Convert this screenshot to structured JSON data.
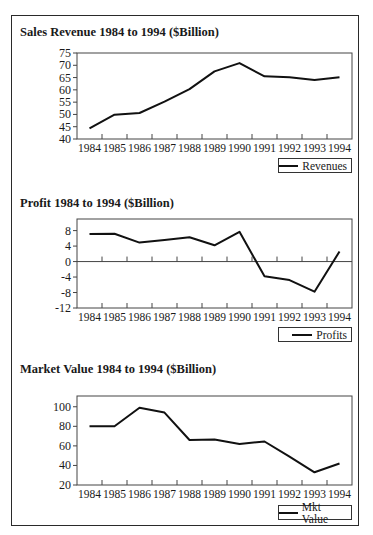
{
  "chart_data": [
    {
      "type": "line",
      "title": "Sales Revenue 1984 to 1994 ($Billion)",
      "xlabel": "",
      "ylabel": "",
      "categories": [
        "1984",
        "1985",
        "1986",
        "1987",
        "1988",
        "1989",
        "1990",
        "1991",
        "1992",
        "1993",
        "1994"
      ],
      "series": [
        {
          "name": "Revenues",
          "values": [
            44.3,
            49.9,
            50.6,
            55.2,
            60.3,
            67.5,
            70.9,
            65.5,
            65.1,
            64.0,
            65.1
          ]
        }
      ],
      "yticks": [
        40,
        45,
        50,
        55,
        60,
        65,
        70,
        75
      ],
      "ylim": [
        40,
        75
      ],
      "grid": false,
      "legend_position": "bottom-right"
    },
    {
      "type": "line",
      "title": "Profit 1984 to 1994 ($Billion)",
      "xlabel": "",
      "ylabel": "",
      "categories": [
        "1984",
        "1985",
        "1986",
        "1987",
        "1988",
        "1989",
        "1990",
        "1991",
        "1992",
        "1993",
        "1994"
      ],
      "series": [
        {
          "name": "Profits",
          "values": [
            7.1,
            7.2,
            4.9,
            5.6,
            6.3,
            4.2,
            7.7,
            -3.8,
            -4.8,
            -7.8,
            2.6
          ]
        }
      ],
      "yticks": [
        -12,
        -8,
        -4,
        0,
        4,
        8
      ],
      "ylim": [
        -12,
        11
      ],
      "zero_line": true,
      "grid": false,
      "legend_position": "bottom-right"
    },
    {
      "type": "line",
      "title": "Market Value 1984 to 1994 ($Billion)",
      "xlabel": "",
      "ylabel": "",
      "categories": [
        "1984",
        "1985",
        "1986",
        "1987",
        "1988",
        "1989",
        "1990",
        "1991",
        "1992",
        "1993",
        "1994"
      ],
      "series": [
        {
          "name": "Mkt Value",
          "values": [
            80,
            80,
            99,
            94,
            66,
            66.5,
            62,
            64.5,
            49,
            33,
            42
          ]
        }
      ],
      "yticks": [
        20,
        40,
        60,
        80,
        100
      ],
      "ylim": [
        20,
        111
      ],
      "grid": false,
      "legend_position": "bottom-right"
    }
  ],
  "layout": {
    "charts": [
      {
        "title_top": 31,
        "plot_left": 77,
        "plot_right": 352,
        "plot_top": 53,
        "plot_bottom": 139,
        "xlabel_y": 152,
        "legend": {
          "left": 278,
          "top": 158,
          "width": 74
        }
      },
      {
        "title_top": 203,
        "plot_left": 77,
        "plot_right": 352,
        "plot_top": 219,
        "plot_bottom": 308,
        "xlabel_y": 321,
        "legend": {
          "left": 278,
          "top": 327,
          "width": 74
        }
      },
      {
        "title_top": 368,
        "plot_left": 77,
        "plot_right": 352,
        "plot_top": 396,
        "plot_bottom": 485,
        "xlabel_y": 498,
        "legend": {
          "left": 278,
          "top": 505,
          "width": 74
        }
      }
    ]
  },
  "colors": {
    "line": "#111111",
    "axis": "#444444",
    "frame": "#2a2a2a"
  }
}
